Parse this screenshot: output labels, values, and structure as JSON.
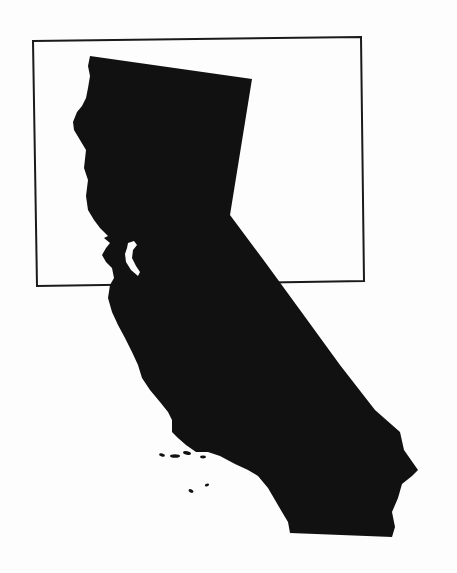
{
  "map": {
    "subject": "California",
    "style": "solid black silhouette",
    "fill_color": "#111111",
    "background_color": "#fdfdfd",
    "highlight_box": {
      "description": "rectangular frame around northern California",
      "stroke_color": "#1a1a1a"
    },
    "features": [
      "state outline",
      "San Francisco Bay",
      "Channel Islands"
    ]
  }
}
